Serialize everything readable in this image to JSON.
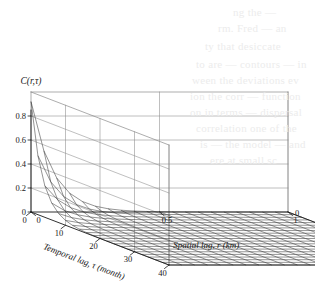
{
  "figure": {
    "title": "C(r,τ)",
    "background_color": "#ffffff",
    "line_color": "#2b2b2b"
  },
  "axes": {
    "z": {
      "label": "",
      "ticks": [
        "0.8",
        "0.6",
        "0.4",
        "0.2",
        "0"
      ],
      "tick_values": [
        0.8,
        0.6,
        0.4,
        0.2,
        0
      ],
      "range": [
        0,
        1.0
      ]
    },
    "x": {
      "label": "Temporal lag, τ (month)",
      "ticks": [
        "0",
        "10",
        "20",
        "30",
        "40"
      ],
      "tick_values": [
        0,
        10,
        20,
        30,
        40
      ],
      "range": [
        0,
        40
      ],
      "units": "month"
    },
    "y": {
      "label": "Spatial lag, r (km)",
      "ticks": [
        "0",
        "0.5",
        "1"
      ],
      "tick_values": [
        0,
        0.5,
        1
      ],
      "range": [
        0,
        1
      ],
      "units": "km",
      "corner_tick": "0"
    }
  },
  "ghost_text": [
    {
      "text": "ng the —",
      "x": 233,
      "y": 6
    },
    {
      "text": "rm. Fred — an",
      "x": 218,
      "y": 22
    },
    {
      "text": "ty that desiccate",
      "x": 205,
      "y": 40
    },
    {
      "text": "to are — contours — in",
      "x": 196,
      "y": 58
    },
    {
      "text": "ween the deviations ev",
      "x": 192,
      "y": 74
    },
    {
      "text": "ion the corr — function",
      "x": 190,
      "y": 90
    },
    {
      "text": "on in terms — dispersal",
      "x": 190,
      "y": 106
    },
    {
      "text": "correlation one of the",
      "x": 196,
      "y": 122
    },
    {
      "text": "is — the model — and",
      "x": 200,
      "y": 138
    },
    {
      "text": "ere at small sc",
      "x": 210,
      "y": 154
    }
  ],
  "chart_data": {
    "type": "surface",
    "title": "C(r,τ)",
    "xlabel": "Temporal lag, τ (month)",
    "ylabel": "Spatial lag, r (km)",
    "zlabel": "C(r,τ)",
    "xlim": [
      0,
      40
    ],
    "ylim": [
      0,
      1
    ],
    "zlim": [
      0,
      1.0
    ],
    "grid": true,
    "legend": null,
    "mesh": {
      "nx": 21,
      "ny": 21
    },
    "model": {
      "form": "C(r,tau) = A * exp(-r/a) * exp(-tau/b)",
      "A": 0.92,
      "a_km": 0.085,
      "b_month": 3.2
    },
    "peak_value": 0.9,
    "peak_at": {
      "r": 0,
      "tau": 0
    },
    "sample_points": [
      {
        "r": 0.0,
        "tau": 0,
        "C": 0.9
      },
      {
        "r": 0.0,
        "tau": 4,
        "C": 0.26
      },
      {
        "r": 0.0,
        "tau": 8,
        "C": 0.075
      },
      {
        "r": 0.0,
        "tau": 20,
        "C": 0.002
      },
      {
        "r": 0.0,
        "tau": 40,
        "C": 0.0
      },
      {
        "r": 0.05,
        "tau": 0,
        "C": 0.51
      },
      {
        "r": 0.1,
        "tau": 0,
        "C": 0.28
      },
      {
        "r": 0.2,
        "tau": 0,
        "C": 0.085
      },
      {
        "r": 0.5,
        "tau": 0,
        "C": 0.003
      },
      {
        "r": 1.0,
        "tau": 0,
        "C": 0.0
      },
      {
        "r": 0.1,
        "tau": 4,
        "C": 0.08
      },
      {
        "r": 0.5,
        "tau": 20,
        "C": 0.0
      },
      {
        "r": 1.0,
        "tau": 40,
        "C": 0.0
      }
    ]
  }
}
